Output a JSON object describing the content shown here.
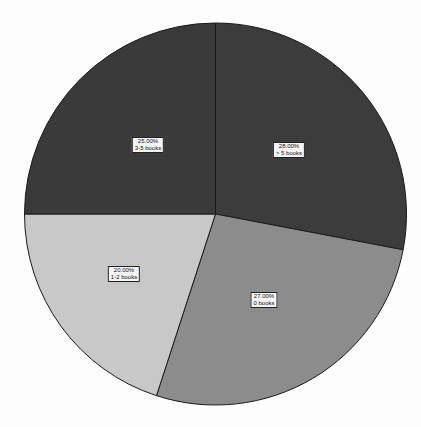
{
  "chart_data": {
    "type": "pie",
    "title": "",
    "categories": [
      "> 5 books",
      "0 books",
      "1-2 books",
      "3-5 books"
    ],
    "values": [
      28.0,
      27.0,
      20.0,
      25.0
    ],
    "labels": [
      "28.00%",
      "27.00%",
      "20.00%",
      "25.00%"
    ],
    "colors": [
      "#3c3c3c",
      "#8c8c8c",
      "#c8c8c8",
      "#3a3a3a"
    ],
    "start_angle_deg": 0,
    "direction": "clockwise",
    "legend": "none"
  },
  "slices": [
    {
      "pct": "28.00%",
      "name": "> 5 books",
      "lx": 289,
      "ly": 150
    },
    {
      "pct": "27.00%",
      "name": "0 books",
      "lx": 264,
      "ly": 300
    },
    {
      "pct": "20.00%",
      "name": "1-2 books",
      "lx": 124,
      "ly": 274
    },
    {
      "pct": "25.00%",
      "name": "3-5 books",
      "lx": 148,
      "ly": 145
    }
  ]
}
